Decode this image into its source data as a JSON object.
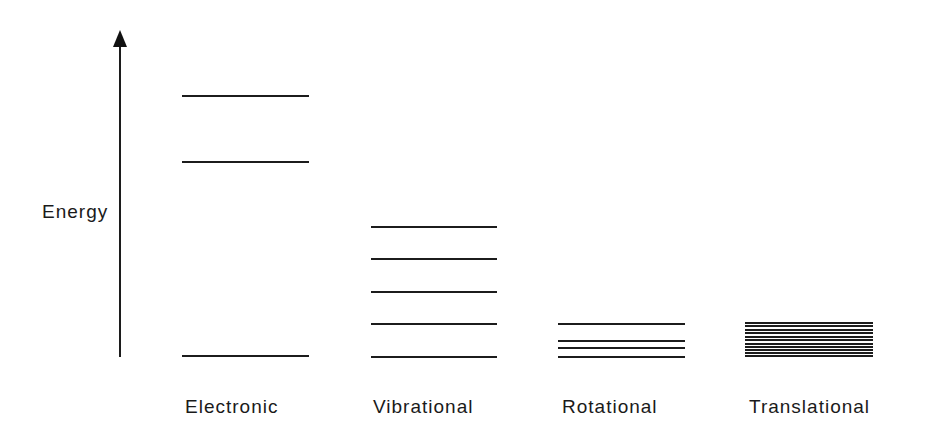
{
  "axis": {
    "label": "Energy",
    "direction": "up",
    "x": 120,
    "y_top": 30,
    "y_bottom": 357
  },
  "columns": [
    {
      "label": "Electronic",
      "x1": 182,
      "x2": 309,
      "levels_y": [
        96,
        162,
        356
      ],
      "label_x": 185
    },
    {
      "label": "Vibrational",
      "x1": 371,
      "x2": 497,
      "levels_y": [
        227,
        259,
        292,
        324,
        357
      ],
      "label_x": 373
    },
    {
      "label": "Rotational",
      "x1": 558,
      "x2": 685,
      "levels_y": [
        324,
        341,
        348,
        357
      ],
      "label_x": 562
    },
    {
      "label": "Translational",
      "x1": 745,
      "x2": 873,
      "levels_y": [
        323,
        326,
        330,
        333,
        337,
        340,
        344,
        347,
        350,
        353,
        356
      ],
      "label_x": 748
    }
  ],
  "colors": {
    "line": "#1c1c1c",
    "text": "#1a1a1a",
    "background": "#ffffff"
  }
}
